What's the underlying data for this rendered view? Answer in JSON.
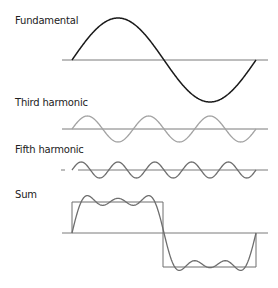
{
  "diagram": {
    "panels": [
      {
        "id": "fundamental",
        "label": "Fundamental",
        "harmonic": 1,
        "amplitude_ratio": 1,
        "color": "#1a1a1a"
      },
      {
        "id": "third",
        "label": "Third harmonic",
        "harmonic": 3,
        "amplitude_ratio": 0.333,
        "color": "#a3a3a3"
      },
      {
        "id": "fifth",
        "label": "Fifth harmonic",
        "harmonic": 5,
        "amplitude_ratio": 0.2,
        "color": "#6e6e6e"
      },
      {
        "id": "sum",
        "label": "Sum",
        "harmonics": [
          1,
          3,
          5
        ],
        "color": "#6e6e6e",
        "overlay": "square-wave"
      }
    ],
    "axis_color": "#7a7a7a",
    "square_color": "#6e6e6e"
  }
}
